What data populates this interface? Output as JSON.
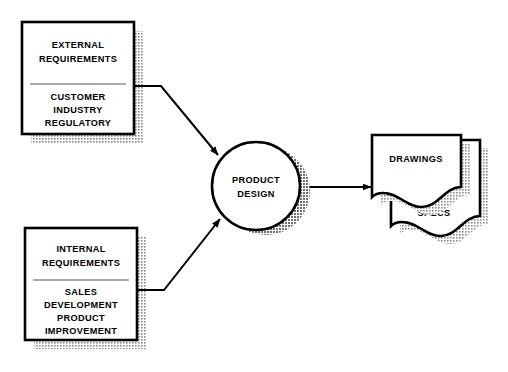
{
  "diagram": {
    "background_color": "#ffffff",
    "line_color": "#000000",
    "shadow_color": "#9a9a9a",
    "nodes": {
      "external_box": {
        "header_line_1": "EXTERNAL",
        "header_line_2": "REQUIREMENTS",
        "items": [
          "CUSTOMER",
          "INDUSTRY",
          "REGULATORY"
        ]
      },
      "internal_box": {
        "header_line_1": "INTERNAL",
        "header_line_2": "REQUIREMENTS",
        "items": [
          "SALES",
          "DEVELOPMENT",
          "PRODUCT",
          "IMPROVEMENT"
        ]
      },
      "process_circle": {
        "label_line_1": "PRODUCT",
        "label_line_2": "DESIGN"
      },
      "output_documents": {
        "front_label": "DRAWINGS",
        "back_label": "SPECS"
      }
    },
    "connectors": [
      {
        "name": "external-to-design",
        "from": "external_box",
        "to": "process_circle",
        "style": "elbow-arrow"
      },
      {
        "name": "internal-to-design",
        "from": "internal_box",
        "to": "process_circle",
        "style": "elbow-arrow"
      },
      {
        "name": "design-to-documents",
        "from": "process_circle",
        "to": "output_documents",
        "style": "straight-arrow"
      }
    ]
  }
}
